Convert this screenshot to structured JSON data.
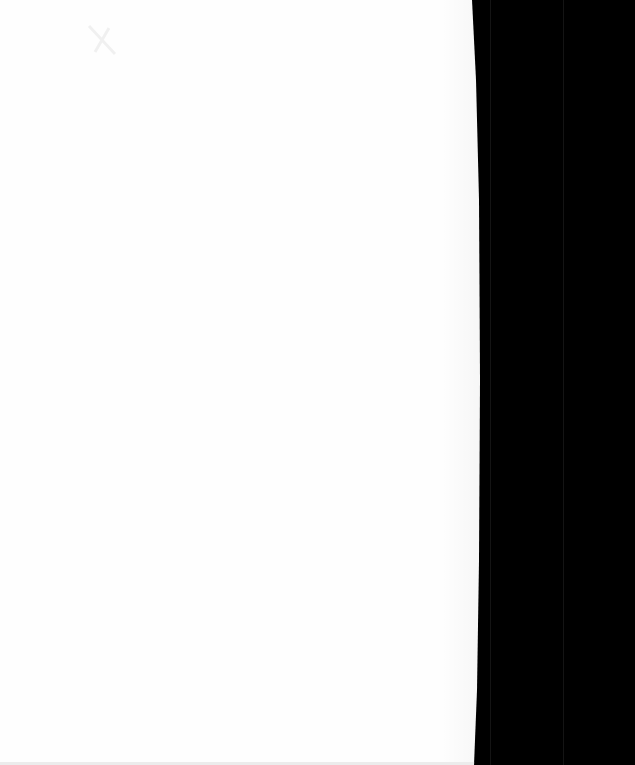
{
  "document": {
    "type": "blank-scanned-page",
    "page_color": "#fefefe",
    "background_color": "#000000",
    "text": ""
  }
}
